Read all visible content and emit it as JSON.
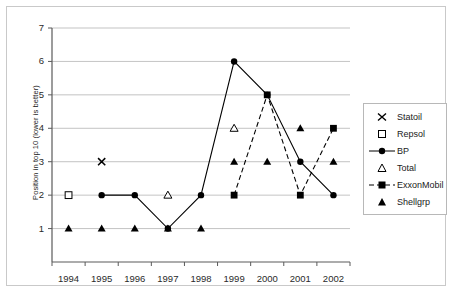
{
  "chart_data": {
    "type": "line",
    "title": "",
    "xlabel": "",
    "ylabel": "Position in top 10 (lower is better)",
    "categories": [
      "1994",
      "1995",
      "1996",
      "1997",
      "1998",
      "1999",
      "2000",
      "2001",
      "2002"
    ],
    "ylim": [
      0,
      7
    ],
    "yticks": [
      0,
      1,
      2,
      3,
      4,
      5,
      6,
      7
    ],
    "grid": "horizontal",
    "legend_position": "right",
    "series": [
      {
        "name": "Statoil",
        "marker": "cross-x",
        "line": "none",
        "color": "#000000",
        "x": [
          "1995"
        ],
        "values": [
          3
        ]
      },
      {
        "name": "Repsol",
        "marker": "open-square",
        "line": "none",
        "color": "#000000",
        "x": [
          "1994"
        ],
        "values": [
          2
        ]
      },
      {
        "name": "BP",
        "marker": "filled-circle",
        "line": "solid",
        "color": "#000000",
        "x": [
          "1995",
          "1996",
          "1997",
          "1998",
          "1999",
          "2000",
          "2001",
          "2002"
        ],
        "values": [
          2,
          2,
          1,
          2,
          6,
          5,
          3,
          2
        ]
      },
      {
        "name": "Total",
        "marker": "open-triangle",
        "line": "none",
        "color": "#000000",
        "x": [
          "1997",
          "1999"
        ],
        "values": [
          2,
          4
        ]
      },
      {
        "name": "ExxonMobil",
        "marker": "filled-square",
        "line": "dashed",
        "color": "#000000",
        "x": [
          "1999",
          "2000",
          "2001",
          "2002"
        ],
        "values": [
          2,
          5,
          2,
          4
        ]
      },
      {
        "name": "Shellgrp",
        "marker": "filled-triangle",
        "line": "none",
        "color": "#000000",
        "x": [
          "1994",
          "1995",
          "1996",
          "1997",
          "1998",
          "1999",
          "2000",
          "2001",
          "2002"
        ],
        "values": [
          1,
          1,
          1,
          1,
          1,
          3,
          3,
          4,
          3
        ]
      }
    ]
  },
  "axis": {
    "yticks": [
      "0",
      "1",
      "2",
      "3",
      "4",
      "5",
      "6",
      "7"
    ],
    "xticks": [
      "1994",
      "1995",
      "1996",
      "1997",
      "1998",
      "1999",
      "2000",
      "2001",
      "2002"
    ],
    "ylabel": "Position in top 10 (lower is better)"
  },
  "legend": {
    "items": [
      {
        "label": "Statoil",
        "marker": "cross-x-icon"
      },
      {
        "label": "Repsol",
        "marker": "open-square-icon"
      },
      {
        "label": "BP",
        "marker": "filled-circle-line-icon"
      },
      {
        "label": "Total",
        "marker": "open-triangle-icon"
      },
      {
        "label": "ExxonMobil",
        "marker": "filled-square-dashed-line-icon"
      },
      {
        "label": "Shellgrp",
        "marker": "filled-triangle-icon"
      }
    ]
  },
  "colors": {
    "ink": "#000000",
    "grid": "#b4b4b4",
    "axis": "#5a5a5a",
    "frame": "#c9c9c9"
  }
}
